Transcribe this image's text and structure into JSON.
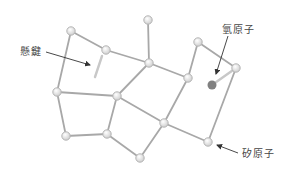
{
  "labels": {
    "hydrogen": "氫原子",
    "dangling_bond": "懸鍵",
    "silicon": "矽原子"
  },
  "colors": {
    "bond": "#a8a8a8",
    "bond_dark": "#8a8a8a",
    "atom_fill": "#e2e2e2",
    "atom_stroke": "#b5b5b5",
    "hydrogen_fill": "#808080",
    "arrow": "#333333",
    "text": "#444444"
  },
  "atoms": [
    {
      "id": "A",
      "x": 71,
      "y": 31
    },
    {
      "id": "B",
      "x": 106,
      "y": 50
    },
    {
      "id": "C",
      "x": 148,
      "y": 20
    },
    {
      "id": "D",
      "x": 149,
      "y": 63
    },
    {
      "id": "E",
      "x": 188,
      "y": 78
    },
    {
      "id": "F",
      "x": 198,
      "y": 42
    },
    {
      "id": "G",
      "x": 236,
      "y": 68
    },
    {
      "id": "I",
      "x": 57,
      "y": 92
    },
    {
      "id": "J",
      "x": 117,
      "y": 96
    },
    {
      "id": "K",
      "x": 164,
      "y": 123
    },
    {
      "id": "L",
      "x": 66,
      "y": 136
    },
    {
      "id": "M",
      "x": 107,
      "y": 134
    },
    {
      "id": "N",
      "x": 140,
      "y": 158
    },
    {
      "id": "O",
      "x": 208,
      "y": 142
    }
  ],
  "bonds": [
    [
      "A",
      "B"
    ],
    [
      "A",
      "I"
    ],
    [
      "B",
      "D"
    ],
    [
      "C",
      "D"
    ],
    [
      "D",
      "E"
    ],
    [
      "D",
      "J"
    ],
    [
      "E",
      "F"
    ],
    [
      "E",
      "K"
    ],
    [
      "F",
      "G"
    ],
    [
      "G",
      "O"
    ],
    [
      "I",
      "J"
    ],
    [
      "I",
      "L"
    ],
    [
      "J",
      "K"
    ],
    [
      "J",
      "M"
    ],
    [
      "L",
      "M"
    ],
    [
      "M",
      "N"
    ],
    [
      "N",
      "K"
    ],
    [
      "K",
      "O"
    ]
  ],
  "hydrogen_atom": {
    "x": 212,
    "y": 85,
    "bonded_to": "G"
  },
  "dangling_bond_stub": {
    "x1": 102,
    "y1": 56,
    "x2": 95,
    "y2": 77
  }
}
